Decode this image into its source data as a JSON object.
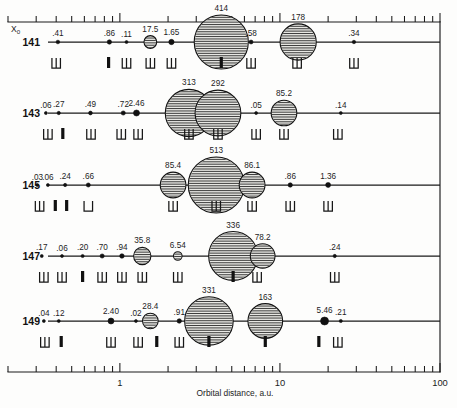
{
  "chart_data": {
    "type": "scatter",
    "title": "",
    "xlabel": "Orbital distance, a.u.",
    "ylabel": "X0",
    "xscale": "log",
    "xlim": [
      0.2,
      100
    ],
    "grid": false,
    "legend": null,
    "x_tick_labels": [
      "1",
      "10",
      "100"
    ],
    "x_tick_values": [
      1,
      10,
      100
    ],
    "row_axis_label": "X",
    "row_axis_sub": "0",
    "series": [
      {
        "name": "141",
        "points": [
          {
            "label": ".41",
            "x": 0.41,
            "size": 0.41,
            "marker": "dot"
          },
          {
            "label": ".86",
            "x": 0.86,
            "size": 0.86,
            "marker": "dot"
          },
          {
            "label": ".11",
            "x": 1.1,
            "size": 0.11,
            "marker": "dot"
          },
          {
            "label": "17.5",
            "x": 1.55,
            "size": 17.5,
            "marker": "bubble"
          },
          {
            "label": "1.65",
            "x": 2.1,
            "size": 1.65,
            "marker": "dot"
          },
          {
            "label": "414",
            "x": 4.3,
            "size": 414,
            "marker": "bubble"
          },
          {
            "label": ".58",
            "x": 6.6,
            "size": 0.58,
            "marker": "dot"
          },
          {
            "label": "178",
            "x": 13.0,
            "size": 178,
            "marker": "bubble"
          },
          {
            "label": ".34",
            "x": 29.0,
            "size": 0.34,
            "marker": "dot"
          }
        ],
        "marks": [
          {
            "x": 0.4,
            "type": "u",
            "legs": 3
          },
          {
            "x": 0.85,
            "type": "bar"
          },
          {
            "x": 1.1,
            "type": "u",
            "legs": 3
          },
          {
            "x": 1.55,
            "type": "u",
            "legs": 3
          },
          {
            "x": 2.1,
            "type": "u",
            "legs": 3
          },
          {
            "x": 4.3,
            "type": "bar"
          },
          {
            "x": 6.6,
            "type": "u",
            "legs": 3
          },
          {
            "x": 12.8,
            "type": "u",
            "legs": 3
          },
          {
            "x": 29.0,
            "type": "u",
            "legs": 3
          }
        ]
      },
      {
        "name": "143",
        "points": [
          {
            "label": ".06",
            "x": 0.345,
            "size": 0.06,
            "marker": "dot"
          },
          {
            "label": ".27",
            "x": 0.415,
            "size": 0.27,
            "marker": "dot"
          },
          {
            "label": ".49",
            "x": 0.655,
            "size": 0.49,
            "marker": "dot"
          },
          {
            "label": ".72",
            "x": 1.05,
            "size": 0.72,
            "marker": "dot"
          },
          {
            "label": "2.46",
            "x": 1.27,
            "size": 2.46,
            "marker": "dot"
          },
          {
            "label": "313",
            "x": 2.7,
            "size": 313,
            "marker": "bubble"
          },
          {
            "label": "292",
            "x": 4.1,
            "size": 292,
            "marker": "bubble"
          },
          {
            "label": ".05",
            "x": 7.1,
            "size": 0.05,
            "marker": "dot"
          },
          {
            "label": "85.2",
            "x": 10.6,
            "size": 85.2,
            "marker": "bubble"
          },
          {
            "label": ".14",
            "x": 24.0,
            "size": 0.14,
            "marker": "dot"
          }
        ],
        "marks": [
          {
            "x": 0.355,
            "type": "u",
            "legs": 3
          },
          {
            "x": 0.44,
            "type": "bar"
          },
          {
            "x": 0.66,
            "type": "u",
            "legs": 3
          },
          {
            "x": 1.02,
            "type": "u",
            "legs": 3
          },
          {
            "x": 1.3,
            "type": "u",
            "legs": 3
          },
          {
            "x": 2.7,
            "type": "u",
            "legs": 3
          },
          {
            "x": 4.1,
            "type": "u",
            "legs": 3
          },
          {
            "x": 7.1,
            "type": "u",
            "legs": 3
          },
          {
            "x": 10.6,
            "type": "u",
            "legs": 3
          },
          {
            "x": 23.0,
            "type": "u",
            "legs": 3
          }
        ]
      },
      {
        "name": "145",
        "points": [
          {
            "label": ".03",
            "x": 0.305,
            "size": 0.03,
            "marker": "dot"
          },
          {
            "label": ".06",
            "x": 0.355,
            "size": 0.06,
            "marker": "dot"
          },
          {
            "label": ".24",
            "x": 0.455,
            "size": 0.24,
            "marker": "dot"
          },
          {
            "label": ".66",
            "x": 0.635,
            "size": 0.66,
            "marker": "dot"
          },
          {
            "label": "85.4",
            "x": 2.15,
            "size": 85.4,
            "marker": "bubble"
          },
          {
            "label": "513",
            "x": 4.0,
            "size": 513,
            "marker": "bubble"
          },
          {
            "label": "86.1",
            "x": 6.7,
            "size": 86.1,
            "marker": "bubble"
          },
          {
            "label": ".86",
            "x": 11.6,
            "size": 0.86,
            "marker": "dot"
          },
          {
            "label": "1.36",
            "x": 20.0,
            "size": 1.36,
            "marker": "dot"
          }
        ],
        "marks": [
          {
            "x": 0.315,
            "type": "u",
            "legs": 3
          },
          {
            "x": 0.395,
            "type": "bar"
          },
          {
            "x": 0.465,
            "type": "bar"
          },
          {
            "x": 0.635,
            "type": "u",
            "legs": 2
          },
          {
            "x": 2.15,
            "type": "u",
            "legs": 3
          },
          {
            "x": 4.0,
            "type": "u",
            "legs": 3
          },
          {
            "x": 6.7,
            "type": "u",
            "legs": 3
          },
          {
            "x": 11.6,
            "type": "u",
            "legs": 3
          },
          {
            "x": 20.0,
            "type": "u",
            "legs": 3
          }
        ]
      },
      {
        "name": "147",
        "points": [
          {
            "label": ".17",
            "x": 0.325,
            "size": 0.17,
            "marker": "dot"
          },
          {
            "label": ".06",
            "x": 0.435,
            "size": 0.06,
            "marker": "dot"
          },
          {
            "label": ".20",
            "x": 0.585,
            "size": 0.2,
            "marker": "dot"
          },
          {
            "label": ".70",
            "x": 0.775,
            "size": 0.7,
            "marker": "dot"
          },
          {
            "label": ".94",
            "x": 1.03,
            "size": 0.94,
            "marker": "dot"
          },
          {
            "label": "35.8",
            "x": 1.38,
            "size": 35.8,
            "marker": "bubble"
          },
          {
            "label": "6.54",
            "x": 2.3,
            "size": 6.54,
            "marker": "bubble"
          },
          {
            "label": "336",
            "x": 5.1,
            "size": 336,
            "marker": "bubble"
          },
          {
            "label": "78.2",
            "x": 7.8,
            "size": 78.2,
            "marker": "bubble"
          },
          {
            "label": ".24",
            "x": 22.0,
            "size": 0.24,
            "marker": "dot"
          }
        ],
        "marks": [
          {
            "x": 0.335,
            "type": "u",
            "legs": 3
          },
          {
            "x": 0.435,
            "type": "u",
            "legs": 3
          },
          {
            "x": 0.585,
            "type": "bar"
          },
          {
            "x": 0.775,
            "type": "u",
            "legs": 3
          },
          {
            "x": 1.03,
            "type": "u",
            "legs": 3
          },
          {
            "x": 1.38,
            "type": "u",
            "legs": 3
          },
          {
            "x": 2.3,
            "type": "u",
            "legs": 3
          },
          {
            "x": 5.1,
            "type": "bar"
          },
          {
            "x": 7.2,
            "type": "u",
            "legs": 3
          },
          {
            "x": 22.0,
            "type": "u",
            "legs": 3
          }
        ]
      },
      {
        "name": "149",
        "points": [
          {
            "label": ".04",
            "x": 0.335,
            "size": 0.04,
            "marker": "dot"
          },
          {
            "label": ".12",
            "x": 0.415,
            "size": 0.12,
            "marker": "dot"
          },
          {
            "label": "2.40",
            "x": 0.88,
            "size": 2.4,
            "marker": "dot"
          },
          {
            "label": ".02",
            "x": 1.26,
            "size": 0.02,
            "marker": "dot"
          },
          {
            "label": "28.4",
            "x": 1.55,
            "size": 28.4,
            "marker": "bubble"
          },
          {
            "label": ".91",
            "x": 2.35,
            "size": 0.91,
            "marker": "dot"
          },
          {
            "label": "331",
            "x": 3.6,
            "size": 331,
            "marker": "bubble"
          },
          {
            "label": "163",
            "x": 8.1,
            "size": 163,
            "marker": "bubble"
          },
          {
            "label": "5.46",
            "x": 19.0,
            "size": 5.46,
            "marker": "bubble"
          },
          {
            "label": ".21",
            "x": 24.0,
            "size": 0.21,
            "marker": "dot"
          }
        ],
        "marks": [
          {
            "x": 0.34,
            "type": "u",
            "legs": 3
          },
          {
            "x": 0.43,
            "type": "bar"
          },
          {
            "x": 0.88,
            "type": "u",
            "legs": 3
          },
          {
            "x": 1.3,
            "type": "u",
            "legs": 3
          },
          {
            "x": 1.7,
            "type": "bar"
          },
          {
            "x": 2.35,
            "type": "u",
            "legs": 3
          },
          {
            "x": 3.6,
            "type": "bar"
          },
          {
            "x": 8.1,
            "type": "bar"
          },
          {
            "x": 17.5,
            "type": "bar"
          },
          {
            "x": 23.0,
            "type": "u",
            "legs": 3
          }
        ]
      }
    ]
  },
  "colors": {
    "ink": "#1a1a1a",
    "bubble_fill": "#e8e8e4",
    "background": "#fdfdfc"
  }
}
